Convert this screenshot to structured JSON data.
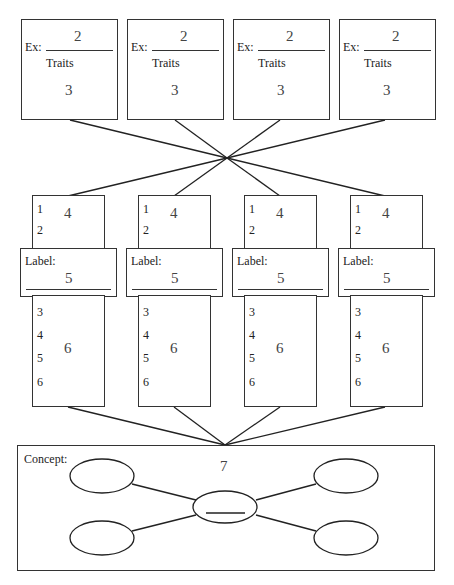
{
  "top_boxes": [
    {
      "ex_label": "Ex:",
      "blank_number": "2",
      "traits_label": "Traits",
      "traits_number": "3"
    },
    {
      "ex_label": "Ex:",
      "blank_number": "2",
      "traits_label": "Traits",
      "traits_number": "3"
    },
    {
      "ex_label": "Ex:",
      "blank_number": "2",
      "traits_label": "Traits",
      "traits_number": "3"
    },
    {
      "ex_label": "Ex:",
      "blank_number": "2",
      "traits_label": "Traits",
      "traits_number": "3"
    }
  ],
  "columns": [
    {
      "upper_items": [
        "1",
        "2"
      ],
      "upper_number": "4",
      "label_text": "Label:",
      "label_number": "5",
      "lower_items": [
        "3",
        "4",
        "5",
        "6"
      ],
      "lower_number": "6"
    },
    {
      "upper_items": [
        "1",
        "2"
      ],
      "upper_number": "4",
      "label_text": "Label:",
      "label_number": "5",
      "lower_items": [
        "3",
        "4",
        "5",
        "6"
      ],
      "lower_number": "6"
    },
    {
      "upper_items": [
        "1",
        "2"
      ],
      "upper_number": "4",
      "label_text": "Label:",
      "label_number": "5",
      "lower_items": [
        "3",
        "4",
        "5",
        "6"
      ],
      "lower_number": "6"
    },
    {
      "upper_items": [
        "1",
        "2"
      ],
      "upper_number": "4",
      "label_text": "Label:",
      "label_number": "5",
      "lower_items": [
        "3",
        "4",
        "5",
        "6"
      ],
      "lower_number": "6"
    }
  ],
  "concept": {
    "label": "Concept:",
    "number": "7",
    "center_node": "______",
    "outer_nodes": [
      "",
      "",
      "",
      ""
    ]
  },
  "colors": {
    "line": "#333333",
    "number_text": "#444444",
    "background": "#ffffff"
  }
}
